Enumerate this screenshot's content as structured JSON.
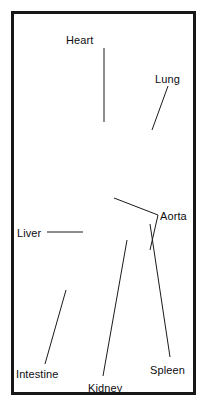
{
  "figure": {
    "kind": "anatomical-illustration",
    "style": "grayscale line drawing with solid flow arrows",
    "frame_color": "#17171a",
    "background_color": "#ffffff",
    "body_tint": "#f2f2f0",
    "vessel_dark": "#4a4a4e",
    "vessel_mid": "#6e6e72",
    "vessel_light": "#9a9a9e",
    "arrow_color": "#000000",
    "leader_color": "#1a1a1c",
    "label_color": "#0d0d0f"
  },
  "labels": [
    {
      "id": "heart",
      "text": "Heart",
      "x": 66,
      "y": 35,
      "anchor_x": 104,
      "anchor_y": 48,
      "tip_x": 104,
      "tip_y": 122
    },
    {
      "id": "lung",
      "text": "Lung",
      "x": 155,
      "y": 74,
      "anchor_x": 168,
      "anchor_y": 86,
      "tip_x": 152,
      "tip_y": 130
    },
    {
      "id": "aorta",
      "text": "Aorta",
      "x": 160,
      "y": 211,
      "anchor_x": 158,
      "anchor_y": 215,
      "tip_x": 114,
      "tip_y": 198
    },
    {
      "id": "liver",
      "text": "Liver",
      "x": 17,
      "y": 228,
      "anchor_x": 47,
      "anchor_y": 232,
      "tip_x": 83,
      "tip_y": 232
    },
    {
      "id": "intestine",
      "text": "Intestine",
      "x": 16,
      "y": 369,
      "anchor_x": 45,
      "anchor_y": 364,
      "tip_x": 66,
      "tip_y": 290
    },
    {
      "id": "kidney",
      "text": "Kidney",
      "x": 88,
      "y": 383,
      "anchor_x": 103,
      "anchor_y": 376,
      "tip_x": 127,
      "tip_y": 240
    },
    {
      "id": "spleen",
      "text": "Spleen",
      "x": 150,
      "y": 365,
      "anchor_x": 170,
      "anchor_y": 357,
      "tip_x": 150,
      "tip_y": 224
    }
  ],
  "organs": [
    {
      "id": "left-lung",
      "name": "left lung",
      "side": "left"
    },
    {
      "id": "right-lung",
      "name": "right lung",
      "side": "right"
    },
    {
      "id": "heart",
      "name": "heart",
      "side": "center"
    },
    {
      "id": "liver",
      "name": "liver",
      "side": "left"
    },
    {
      "id": "spleen",
      "name": "spleen",
      "side": "right"
    },
    {
      "id": "kidney-upper",
      "name": "kidney",
      "side": "right"
    },
    {
      "id": "kidney-lower",
      "name": "kidney",
      "side": "right"
    },
    {
      "id": "intestine",
      "name": "intestine",
      "side": "left"
    }
  ],
  "flow_arrows": [
    {
      "id": "arrow-left-lung-in",
      "x": 71,
      "y": 133,
      "dir": "left"
    },
    {
      "id": "arrow-left-lung-down",
      "x": 76,
      "y": 157,
      "dir": "down"
    },
    {
      "id": "arrow-right-lung-in",
      "x": 143,
      "y": 135,
      "dir": "left"
    },
    {
      "id": "arrow-right-lung-low",
      "x": 139,
      "y": 153,
      "dir": "left"
    },
    {
      "id": "arrow-heart-l",
      "x": 100,
      "y": 163,
      "dir": "down"
    },
    {
      "id": "arrow-heart-r",
      "x": 114,
      "y": 163,
      "dir": "down"
    },
    {
      "id": "arrow-aorta-up",
      "x": 91,
      "y": 191,
      "dir": "up"
    },
    {
      "id": "arrow-aorta-down",
      "x": 110,
      "y": 212,
      "dir": "down"
    },
    {
      "id": "arrow-kidney-up",
      "x": 131,
      "y": 220,
      "dir": "up"
    },
    {
      "id": "arrow-kidney-left",
      "x": 133,
      "y": 239,
      "dir": "left"
    },
    {
      "id": "arrow-portal-up",
      "x": 83,
      "y": 258,
      "dir": "up"
    },
    {
      "id": "arrow-intestine",
      "x": 71,
      "y": 294,
      "dir": "left"
    }
  ]
}
